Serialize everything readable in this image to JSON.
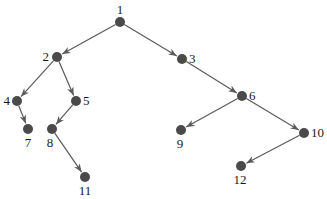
{
  "diagram": {
    "type": "directed-tree",
    "colors": {
      "node": "#4a4a4a",
      "edge": "#5a5a5a",
      "label": "#1a1a1a",
      "background": "#ffffff"
    },
    "nodes": [
      {
        "id": "1",
        "label": "1",
        "x": 120,
        "y": 22,
        "lx": 120,
        "ly": 14,
        "anchor": "middle"
      },
      {
        "id": "2",
        "label": "2",
        "x": 57,
        "y": 57,
        "lx": 49,
        "ly": 61,
        "anchor": "end"
      },
      {
        "id": "3",
        "label": "3",
        "x": 182,
        "y": 59,
        "lx": 189,
        "ly": 63,
        "anchor": "start"
      },
      {
        "id": "4",
        "label": "4",
        "x": 17,
        "y": 101,
        "lx": 10,
        "ly": 105,
        "anchor": "end"
      },
      {
        "id": "5",
        "label": "5",
        "x": 76,
        "y": 101,
        "lx": 83,
        "ly": 105,
        "anchor": "start"
      },
      {
        "id": "6",
        "label": "6",
        "x": 242,
        "y": 96,
        "lx": 249,
        "ly": 100,
        "anchor": "start"
      },
      {
        "id": "7",
        "label": "7",
        "x": 28,
        "y": 129,
        "lx": 28,
        "ly": 147,
        "anchor": "middle"
      },
      {
        "id": "8",
        "label": "8",
        "x": 52,
        "y": 129,
        "lx": 50,
        "ly": 147,
        "anchor": "middle"
      },
      {
        "id": "9",
        "label": "9",
        "x": 181,
        "y": 130,
        "lx": 180,
        "ly": 148,
        "anchor": "middle"
      },
      {
        "id": "10",
        "label": "10",
        "x": 304,
        "y": 133,
        "lx": 311,
        "ly": 137,
        "anchor": "start"
      },
      {
        "id": "11",
        "label": "11",
        "x": 85,
        "y": 177,
        "lx": 85,
        "ly": 195,
        "anchor": "middle"
      },
      {
        "id": "12",
        "label": "12",
        "x": 241,
        "y": 166,
        "lx": 240,
        "ly": 184,
        "anchor": "middle"
      }
    ],
    "edges": [
      {
        "from": "1",
        "to": "2"
      },
      {
        "from": "1",
        "to": "3"
      },
      {
        "from": "2",
        "to": "4"
      },
      {
        "from": "2",
        "to": "5"
      },
      {
        "from": "3",
        "to": "6"
      },
      {
        "from": "4",
        "to": "7"
      },
      {
        "from": "5",
        "to": "8"
      },
      {
        "from": "6",
        "to": "9"
      },
      {
        "from": "6",
        "to": "10"
      },
      {
        "from": "8",
        "to": "11"
      },
      {
        "from": "10",
        "to": "12"
      }
    ]
  }
}
